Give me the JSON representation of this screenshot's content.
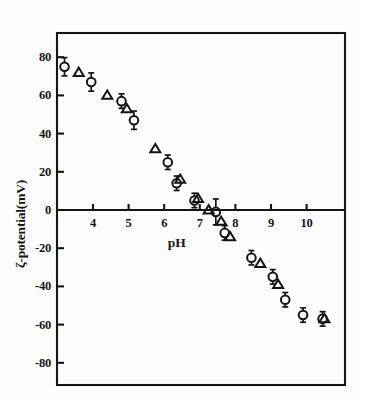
{
  "figure": {
    "background_color": "#fefefe",
    "ink_color": "#151515"
  },
  "chart_data": {
    "type": "scatter",
    "title": "",
    "subtitle": "",
    "xlabel": "pH",
    "ylabel": "ζ-potential(mV)",
    "xlim": [
      2.8,
      11.0
    ],
    "ylim": [
      -92,
      96
    ],
    "x_ticks": [
      4,
      5,
      6,
      7,
      8,
      9,
      10
    ],
    "x_tick_labels": [
      "4",
      "5",
      "6",
      "7",
      "8",
      "9",
      "10"
    ],
    "y_ticks": [
      80,
      60,
      40,
      20,
      0,
      -20,
      -40,
      -60,
      -80
    ],
    "y_tick_labels": [
      "80",
      "60",
      "40",
      "20",
      "0",
      "-20",
      "-40",
      "-60",
      "-80"
    ],
    "grid": false,
    "legend": null,
    "legend_position": "none",
    "annotations": [],
    "series": [
      {
        "name": "circles",
        "marker": "circle",
        "has_error_bars": true,
        "points": [
          {
            "x": 3.2,
            "y": 75,
            "yerr": 4
          },
          {
            "x": 3.95,
            "y": 67,
            "yerr": 4
          },
          {
            "x": 4.8,
            "y": 57,
            "yerr": 3
          },
          {
            "x": 5.15,
            "y": 47,
            "yerr": 4
          },
          {
            "x": 6.1,
            "y": 25,
            "yerr": 3
          },
          {
            "x": 6.35,
            "y": 14,
            "yerr": 3
          },
          {
            "x": 6.85,
            "y": 5,
            "yerr": 3
          },
          {
            "x": 7.45,
            "y": -1,
            "yerr": 6
          },
          {
            "x": 7.7,
            "y": -12,
            "yerr": 3
          },
          {
            "x": 8.45,
            "y": -25,
            "yerr": 3
          },
          {
            "x": 9.05,
            "y": -35,
            "yerr": 3
          },
          {
            "x": 9.4,
            "y": -47,
            "yerr": 3
          },
          {
            "x": 9.9,
            "y": -55,
            "yerr": 3
          },
          {
            "x": 10.45,
            "y": -57,
            "yerr": 3
          }
        ]
      },
      {
        "name": "triangles",
        "marker": "triangle",
        "has_error_bars": false,
        "points": [
          {
            "x": 3.6,
            "y": 72
          },
          {
            "x": 4.4,
            "y": 60
          },
          {
            "x": 4.95,
            "y": 53
          },
          {
            "x": 5.75,
            "y": 32
          },
          {
            "x": 6.45,
            "y": 16
          },
          {
            "x": 6.95,
            "y": 6
          },
          {
            "x": 7.25,
            "y": 0
          },
          {
            "x": 7.6,
            "y": -6
          },
          {
            "x": 7.85,
            "y": -14
          },
          {
            "x": 8.7,
            "y": -28
          },
          {
            "x": 9.2,
            "y": -39
          },
          {
            "x": 10.5,
            "y": -57
          }
        ]
      }
    ]
  }
}
